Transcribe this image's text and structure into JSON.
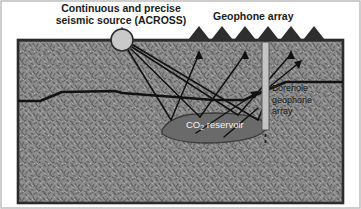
{
  "figure": {
    "width": 361,
    "height": 209,
    "background_color": "#ffffff",
    "border_color": "#2b2b2b"
  },
  "labels": {
    "source_line1": "Continuous and precise",
    "source_line2": "seismic source (ACROSS)",
    "source_full": "Continuous and precise seismic source (ACROSS)",
    "geophone_array": "Geophone array",
    "borehole_line1": "Borehole",
    "borehole_line2": "geophone",
    "borehole_line3": "array",
    "reservoir_prefix": "CO",
    "reservoir_sub": "2",
    "reservoir_suffix": " reservoir"
  },
  "colors": {
    "ground_base": "#8e8e8e",
    "ground_speckle_dark": "#5d5d5d",
    "ground_speckle_light": "#b4b4b4",
    "reservoir_fill": "#6a6a6a",
    "reservoir_stroke": "#3c3c3c",
    "source_fill": "#c9c9c9",
    "source_stroke": "#2a2a2a",
    "geophone_fill": "#2e2e2e",
    "borehole_fill": "#c4c4c4",
    "borehole_stroke": "#555555",
    "ray_color": "#101010",
    "layer_color": "#121212",
    "label_color": "#1a1a1a",
    "reservoir_label_color": "#f2f2f2"
  },
  "geometry": {
    "surface_y": 40,
    "ground_top": 40,
    "ground_bottom": 203,
    "ground_left": 18,
    "ground_right": 343,
    "source": {
      "cx": 122,
      "cy": 40,
      "r": 11
    },
    "geophone_count": 6,
    "geophone_xs": [
      199,
      222,
      245,
      268,
      291,
      314
    ],
    "geophone_half_width": 11,
    "geophone_height": 14,
    "borehole": {
      "x": 262,
      "y_top": 42,
      "y_bottom": 130,
      "width": 7
    },
    "reservoir": {
      "cx": 213,
      "cy": 128,
      "rx": 54,
      "ry": 15
    }
  },
  "diagram": {
    "type": "seismic-monitoring-schematic",
    "ray_paths": [
      {
        "from": "source",
        "to": "reservoir",
        "reflect_to": "geophone-1"
      },
      {
        "from": "source",
        "to": "reservoir",
        "reflect_to": "geophone-3"
      },
      {
        "from": "source",
        "to": "reservoir",
        "reflect_to": "geophone-5"
      },
      {
        "from": "source",
        "to": "reservoir",
        "reflect_to": "borehole"
      }
    ]
  }
}
